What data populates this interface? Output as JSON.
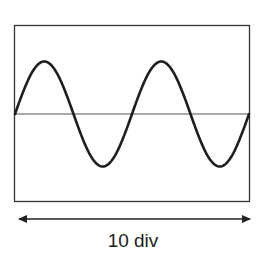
{
  "diagram": {
    "screen": {
      "horizontal_divisions": 10,
      "cycles_shown": 2,
      "waveform": "sine",
      "start_phase": "zero-crossing rising",
      "has_center_line": true
    },
    "span_label": "10 div",
    "colors": {
      "frame": "#333333",
      "waveform": "#1e1e1e",
      "center_line": "#555555",
      "arrow": "#222222",
      "text": "#222222",
      "background": "#ffffff"
    }
  }
}
